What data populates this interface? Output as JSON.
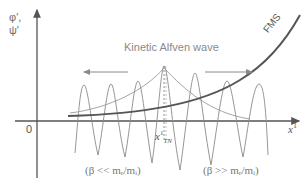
{
  "diagram": {
    "title": "Kinetic Alfven wave",
    "y_axis": {
      "label_line1": "φ′,",
      "label_line2": "ψ′"
    },
    "x_axis": {
      "label": "x",
      "label_superscript": "1",
      "origin_label": "0"
    },
    "turning_point": {
      "label": "x",
      "superscript": "1",
      "subscript": "TN"
    },
    "curve_labels": {
      "fms": "FMS"
    },
    "regimes": {
      "left": "(β << mₑ/mᵢ)",
      "right": "(β >> mₑ/mᵢ)"
    },
    "arrows": {
      "left": "propagation-left",
      "right": "propagation-right"
    },
    "colors": {
      "axis": "#555555",
      "wave": "#8a8a8a",
      "envelope": "#9a9a9a",
      "fms": "#555555",
      "text": "#777777"
    }
  }
}
